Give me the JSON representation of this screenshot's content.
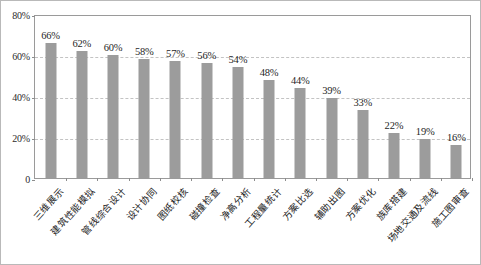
{
  "chart_data": {
    "type": "bar",
    "title": "",
    "subtitle": "",
    "xlabel": "",
    "ylabel": "",
    "ylim": [
      0,
      80
    ],
    "grid": true,
    "legend": false,
    "orientation": "vertical",
    "bar_color": "#9c9c9c",
    "plot_background": "#ffffff",
    "gridline_color": "#c3c3c3",
    "frame_color": "#9a9a9a",
    "yticks": [
      0,
      20,
      40,
      60,
      80
    ],
    "ytick_labels": [
      "0",
      "20%",
      "40%",
      "60%",
      "80%"
    ],
    "categories": [
      "三维展示",
      "建筑性能模拟",
      "管线综合设计",
      "设计协同",
      "图纸校核",
      "碰撞检查",
      "净高分析",
      "工程量统计",
      "方案比选",
      "辅助出图",
      "方案优化",
      "族库搭建",
      "场地交通及流线",
      "施工图审查"
    ],
    "values": [
      66,
      62,
      60,
      58,
      57,
      56,
      54,
      48,
      44,
      39,
      33,
      22,
      19,
      16
    ],
    "data_labels": [
      "66%",
      "62%",
      "60%",
      "58%",
      "57%",
      "56%",
      "54%",
      "48%",
      "44%",
      "39%",
      "33%",
      "22%",
      "19%",
      "16%"
    ]
  }
}
